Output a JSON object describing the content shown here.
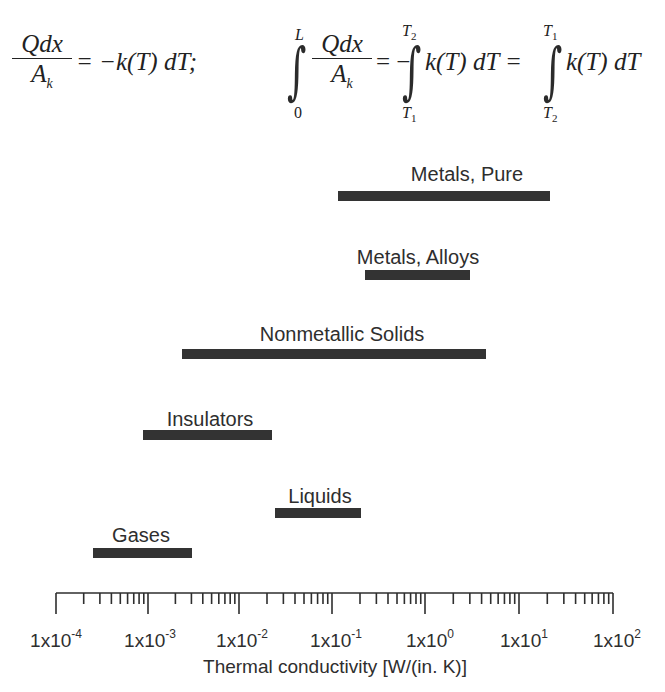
{
  "equations": {
    "left": {
      "numerator": "Qdx",
      "denominator_main": "A",
      "denominator_sub": "k",
      "rhs": "= −k(T) dT;"
    },
    "right": {
      "integral1_upper": "L",
      "integral1_lower": "0",
      "numerator": "Qdx",
      "denominator_main": "A",
      "denominator_sub": "k",
      "eq1": "= −",
      "integral2_upper": "T",
      "integral2_upper_sub": "2",
      "integral2_lower": "T",
      "integral2_lower_sub": "1",
      "integrand1": "k(T) dT =",
      "integral3_upper": "T",
      "integral3_upper_sub": "1",
      "integral3_lower": "T",
      "integral3_lower_sub": "2",
      "integrand2": "k(T) dT"
    }
  },
  "chart_data": {
    "type": "bar",
    "orientation": "horizontal-range",
    "title": "",
    "xlabel": "Thermal conductivity [W/(in. K)]",
    "ylabel": "",
    "xscale": "log",
    "xlim": [
      0.0001,
      100
    ],
    "xticks": [
      "1x10-4",
      "1x10-3",
      "1x10-2",
      "1x10-1",
      "1x100",
      "1x101",
      "1x102"
    ],
    "grid": false,
    "legend": null,
    "categories": [
      "Metals, Pure",
      "Metals, Alloys",
      "Nonmetallic Solids",
      "Insulators",
      "Liquids",
      "Gases"
    ],
    "ranges": [
      {
        "name": "Metals, Pure",
        "min": 0.12,
        "max": 20
      },
      {
        "name": "Metals, Alloys",
        "min": 0.24,
        "max": 3
      },
      {
        "name": "Nonmetallic Solids",
        "min": 0.0025,
        "max": 4.5
      },
      {
        "name": "Insulators",
        "min": 0.0009,
        "max": 0.022
      },
      {
        "name": "Liquids",
        "min": 0.025,
        "max": 0.2
      },
      {
        "name": "Gases",
        "min": 0.0004,
        "max": 0.0032
      }
    ]
  },
  "axis": {
    "ticks": [
      {
        "base": "1x10",
        "exp": "-4"
      },
      {
        "base": "1x10",
        "exp": "-3"
      },
      {
        "base": "1x10",
        "exp": "-2"
      },
      {
        "base": "1x10",
        "exp": "-1"
      },
      {
        "base": "1x10",
        "exp": "0"
      },
      {
        "base": "1x10",
        "exp": "1"
      },
      {
        "base": "1x10",
        "exp": "2"
      }
    ]
  },
  "colors": {
    "bar": "#333333",
    "text": "#2e2e2e",
    "background": "#ffffff"
  }
}
